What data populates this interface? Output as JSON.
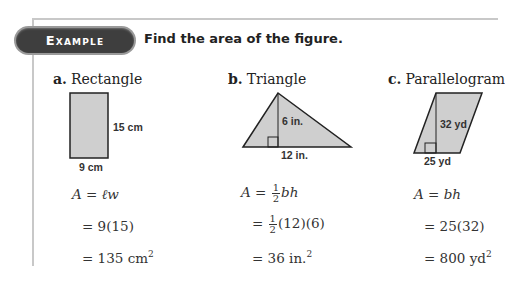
{
  "header": {
    "badge_label": "Example",
    "prompt": "Find the area of the figure."
  },
  "columns": [
    {
      "letter": "a.",
      "shape": "Rectangle",
      "figure": {
        "height_label": "15 cm",
        "base_label": "9 cm"
      },
      "formula": {
        "lhs": "A",
        "eq": "=",
        "rhs": "ℓw"
      },
      "steps": [
        "= 9(15)",
        "= 135 cm"
      ],
      "unit_exponent": "2"
    },
    {
      "letter": "b.",
      "shape": "Triangle",
      "figure": {
        "height_label": "6 in.",
        "base_label": "12 in."
      },
      "formula": {
        "lhs": "A",
        "eq": "=",
        "frac_num": "1",
        "frac_den": "2",
        "rhs": "bh"
      },
      "steps": [
        "(12)(6)",
        "= 36 in."
      ],
      "step1_prefix": "=",
      "unit_exponent": "2"
    },
    {
      "letter": "c.",
      "shape": "Parallelogram",
      "figure": {
        "height_label": "32 yd",
        "base_label": "25 yd"
      },
      "formula": {
        "lhs": "A",
        "eq": "=",
        "rhs": "bh"
      },
      "steps": [
        "= 25(32)",
        "= 800 yd"
      ],
      "unit_exponent": "2"
    }
  ],
  "colors": {
    "badge_bg": "#3e3e3e",
    "figure_fill": "#cfcfcf",
    "frame_line": "#c8c8c8"
  }
}
